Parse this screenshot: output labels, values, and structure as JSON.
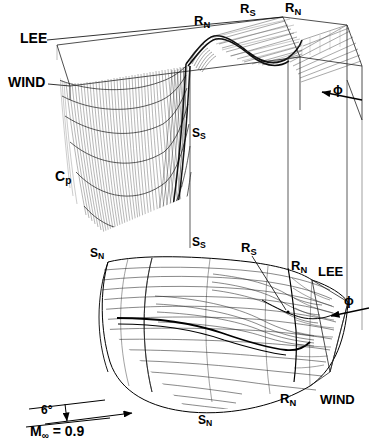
{
  "figure": {
    "type": "3d-surface-and-streamline-diagram",
    "flow_conditions": {
      "mach_label_main": "M",
      "mach_label_sub": "∞",
      "mach_label_eq": " = 0.9",
      "mach_full": "M∞ = 0.9",
      "incidence_angle": "6°"
    },
    "axis_label": {
      "main": "C",
      "sub": "p",
      "full": "Cp"
    },
    "roll_angle_symbol": "ϕ",
    "orientation_labels": {
      "lee_upper": "LEE",
      "wind_upper": "WIND",
      "lee_lower": "LEE",
      "wind_lower": "WIND"
    },
    "topology_labels": [
      {
        "id": "rn-top-left",
        "main": "R",
        "sub": "N",
        "full": "RN",
        "meaning": "reattachment-line-primary",
        "x": 194,
        "y": 14
      },
      {
        "id": "rs-top-mid",
        "main": "R",
        "sub": "S",
        "full": "RS",
        "meaning": "secondary-reattachment-line",
        "x": 240,
        "y": 2
      },
      {
        "id": "rn-top-right",
        "main": "R",
        "sub": "N",
        "full": "RN",
        "meaning": "reattachment-line-primary",
        "x": 285,
        "y": 1
      },
      {
        "id": "ss-upper",
        "main": "S",
        "sub": "S",
        "full": "SS",
        "meaning": "secondary-separation-line",
        "x": 192,
        "y": 127
      },
      {
        "id": "ss-lower",
        "main": "S",
        "sub": "S",
        "full": "SS",
        "meaning": "secondary-separation-line",
        "x": 192,
        "y": 236
      },
      {
        "id": "sn-upper",
        "main": "S",
        "sub": "N",
        "full": "SN",
        "meaning": "primary-separation-line",
        "x": 90,
        "y": 247
      },
      {
        "id": "rs-body",
        "main": "R",
        "sub": "S",
        "full": "RS",
        "meaning": "secondary-reattachment-line",
        "x": 246,
        "y": 243
      },
      {
        "id": "rn-body",
        "main": "R",
        "sub": "N",
        "full": "RN",
        "meaning": "reattachment-line-primary",
        "x": 296,
        "y": 263
      },
      {
        "id": "sn-lower",
        "main": "S",
        "sub": "N",
        "full": "SN",
        "meaning": "primary-separation-line",
        "x": 201,
        "y": 415
      },
      {
        "id": "rn-bottom",
        "main": "R",
        "sub": "N",
        "full": "RN",
        "meaning": "reattachment-line-primary",
        "x": 283,
        "y": 395
      }
    ],
    "colors": {
      "ink": "#000000",
      "mesh": "#3a3a3a",
      "mesh_light": "#777777",
      "background": "#ffffff"
    }
  }
}
